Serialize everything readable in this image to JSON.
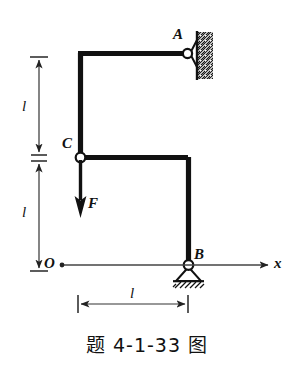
{
  "figure": {
    "caption": "题 4-1-33 图",
    "type": "engineering-statics-frame-diagram",
    "colors": {
      "member": "#111111",
      "thin_line": "#333333",
      "background": "#ffffff",
      "hatch": "#111111"
    },
    "labels": {
      "point_a": "A",
      "point_b": "B",
      "point_c": "C",
      "origin": "O",
      "force": "F",
      "axis_x": "x",
      "dim_vertical_upper": "l",
      "dim_vertical_lower": "l",
      "dim_horizontal": "l"
    },
    "geometry": {
      "corner_top_left": [
        78,
        53
      ],
      "point_a": [
        188,
        53
      ],
      "point_c": [
        80,
        157
      ],
      "corner_mid_right": [
        188,
        157
      ],
      "point_b": [
        188,
        265
      ],
      "origin": [
        60,
        265
      ],
      "x_axis_end": [
        278,
        265
      ],
      "force_arrow_tail": [
        80,
        160
      ],
      "force_arrow_head": [
        80,
        215
      ]
    },
    "supports": {
      "a": "pin-support-vertical-wall",
      "b": "pin-support-ground",
      "c": "internal-hinge"
    },
    "dimensions": {
      "vertical_upper": {
        "from_y": 57,
        "to_y": 155,
        "label": "l"
      },
      "vertical_lower": {
        "from_y": 160,
        "to_y": 265,
        "label": "l"
      },
      "horizontal": {
        "from_x": 78,
        "to_x": 188,
        "label": "l"
      }
    }
  }
}
